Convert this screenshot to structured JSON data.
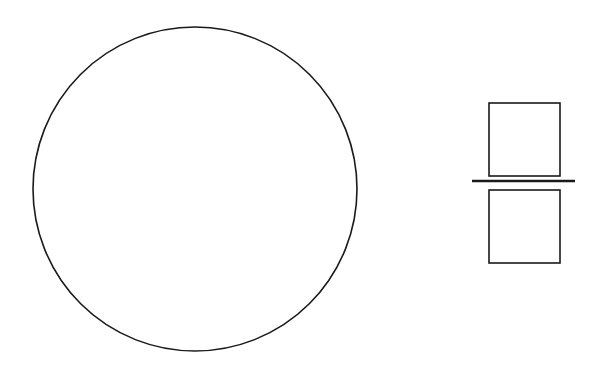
{
  "canvas": {
    "width": 601,
    "height": 376,
    "background": "#ffffff"
  },
  "stroke_color": "#1a1a1a",
  "shapes": {
    "circle": {
      "cx": 195,
      "cy": 189,
      "r": 162,
      "stroke_width": 1.6
    },
    "fraction": {
      "top_square": {
        "x": 489,
        "y": 103,
        "width": 71,
        "height": 73,
        "stroke_width": 1.6
      },
      "divider_line": {
        "x1": 472,
        "y1": 181,
        "x2": 575,
        "y2": 181,
        "stroke_width": 2.4
      },
      "bottom_square": {
        "x": 489,
        "y": 190,
        "width": 71,
        "height": 73,
        "stroke_width": 1.6
      }
    }
  }
}
